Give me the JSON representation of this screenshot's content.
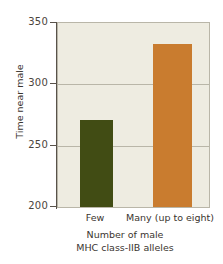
{
  "chart_data": {
    "type": "bar",
    "title": "",
    "xlabel": "Number of male MHC class-IIB alleles",
    "xlabel_lines": [
      "Number of male",
      "MHC class-IIB alleles"
    ],
    "ylabel": "Time near male",
    "categories": [
      "Few",
      "Many (up to eight)"
    ],
    "values": [
      271,
      333
    ],
    "ylim": [
      200,
      350
    ],
    "yticks": [
      200,
      250,
      300,
      350
    ],
    "ytick_labels": [
      "200",
      "250",
      "300",
      "350"
    ],
    "grid": true,
    "grid_axis": "y",
    "legend": false,
    "bar_colors": [
      "#414c14",
      "#c97c2f"
    ],
    "plot_background": "#eeece1",
    "axis_color": "#58524a",
    "gridline_color": "#b9b6a8"
  },
  "axes": {
    "y_title": "Time near male",
    "x_title_line1": "Number of male",
    "x_title_line2": "MHC class-IIB alleles",
    "ytick_0": "200",
    "ytick_1": "250",
    "ytick_2": "300",
    "ytick_3": "350",
    "xtick_0": "Few",
    "xtick_1": "Many (up to eight)"
  }
}
